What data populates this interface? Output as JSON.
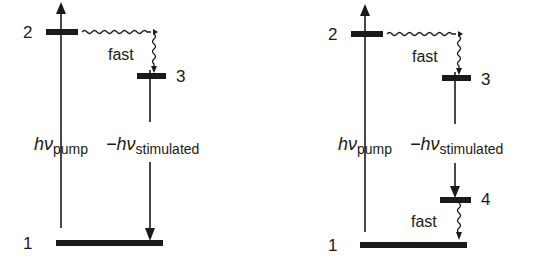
{
  "diagrams": [
    {
      "name": "three-level-laser",
      "levels": [
        {
          "label": "2"
        },
        {
          "label": "3"
        },
        {
          "label": "1"
        }
      ],
      "fast_label": "fast",
      "pump_label": {
        "symbol": "hν",
        "sub": "pump"
      },
      "stim_label": {
        "symbol": "−hν",
        "sub": "stimulated"
      }
    },
    {
      "name": "four-level-laser",
      "levels": [
        {
          "label": "2"
        },
        {
          "label": "3"
        },
        {
          "label": "4"
        },
        {
          "label": "1"
        }
      ],
      "fast_label_top": "fast",
      "fast_label_bottom": "fast",
      "pump_label": {
        "symbol": "hν",
        "sub": "pump"
      },
      "stim_label": {
        "symbol": "−hν",
        "sub": "stimulated"
      }
    }
  ],
  "colors": {
    "ink": "#1a1a1a",
    "background": "#ffffff"
  }
}
